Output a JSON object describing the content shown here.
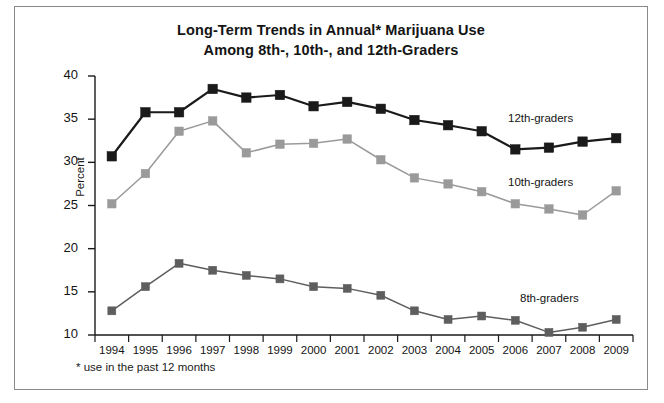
{
  "figure": {
    "title_line1": "Long-Term Trends in Annual* Marijuana Use",
    "title_line2": "Among 8th-, 10th-, and 12th-Graders",
    "footnote": "* use in the past 12 months",
    "border_color": "#8a8a8a",
    "background": "#ffffff"
  },
  "chart_data": {
    "type": "line",
    "title": "Long-Term Trends in Annual* Marijuana Use Among 8th-, 10th-, and 12th-Graders",
    "xlabel": "",
    "ylabel": "Percent",
    "ylim": [
      10,
      40
    ],
    "ytick_values": [
      10,
      15,
      20,
      25,
      30,
      35,
      40
    ],
    "ytick_labels": [
      "10",
      "15",
      "20",
      "25",
      "30",
      "35",
      "40"
    ],
    "grid": false,
    "legend_position": "inline-right",
    "categories": [
      "1994",
      "1995",
      "1996",
      "1997",
      "1998",
      "1999",
      "2000",
      "2001",
      "2002",
      "2003",
      "2004",
      "2005",
      "2006",
      "2007",
      "2008",
      "2009"
    ],
    "series": [
      {
        "name": "12th-graders",
        "color": "#1a1a1a",
        "marker": "square",
        "values": [
          30.7,
          35.8,
          35.8,
          38.5,
          37.5,
          37.8,
          36.5,
          37.0,
          36.2,
          34.9,
          34.3,
          33.6,
          31.5,
          31.7,
          32.4,
          32.8
        ]
      },
      {
        "name": "10th-graders",
        "color": "#9a9a9a",
        "marker": "square",
        "values": [
          25.2,
          28.7,
          33.6,
          34.8,
          31.1,
          32.1,
          32.2,
          32.7,
          30.3,
          28.2,
          27.5,
          26.6,
          25.2,
          24.6,
          23.9,
          26.7
        ]
      },
      {
        "name": "8th-graders",
        "color": "#5e5e5e",
        "marker": "square",
        "values": [
          12.8,
          15.6,
          18.3,
          17.5,
          16.9,
          16.5,
          15.6,
          15.4,
          14.6,
          12.8,
          11.8,
          12.2,
          11.7,
          10.3,
          10.9,
          11.8
        ]
      }
    ]
  }
}
